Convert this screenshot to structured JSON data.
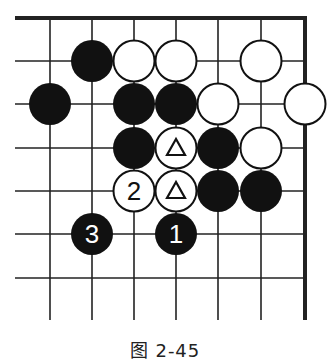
{
  "diagram": {
    "caption": "图 2-45",
    "board": {
      "columns": 7,
      "rows": 7,
      "edges": [
        "top",
        "right"
      ],
      "colors": {
        "black": "#111111",
        "white": "#ffffff",
        "line": "#222222"
      }
    },
    "stones": [
      {
        "col": 1,
        "row": 1,
        "color": "black",
        "label": ""
      },
      {
        "col": 2,
        "row": 1,
        "color": "white",
        "label": ""
      },
      {
        "col": 3,
        "row": 1,
        "color": "white",
        "label": ""
      },
      {
        "col": 5,
        "row": 1,
        "color": "white",
        "label": ""
      },
      {
        "col": 0,
        "row": 2,
        "color": "black",
        "label": ""
      },
      {
        "col": 2,
        "row": 2,
        "color": "black",
        "label": ""
      },
      {
        "col": 3,
        "row": 2,
        "color": "black",
        "label": ""
      },
      {
        "col": 4,
        "row": 2,
        "color": "white",
        "label": ""
      },
      {
        "col": 6,
        "row": 2,
        "color": "white",
        "label": ""
      },
      {
        "col": 2,
        "row": 3,
        "color": "black",
        "label": ""
      },
      {
        "col": 3,
        "row": 3,
        "color": "white",
        "label": "triangle"
      },
      {
        "col": 4,
        "row": 3,
        "color": "black",
        "label": ""
      },
      {
        "col": 5,
        "row": 3,
        "color": "white",
        "label": ""
      },
      {
        "col": 2,
        "row": 4,
        "color": "white",
        "label": "2"
      },
      {
        "col": 3,
        "row": 4,
        "color": "white",
        "label": "triangle"
      },
      {
        "col": 4,
        "row": 4,
        "color": "black",
        "label": ""
      },
      {
        "col": 5,
        "row": 4,
        "color": "black",
        "label": ""
      },
      {
        "col": 1,
        "row": 5,
        "color": "black",
        "label": "3"
      },
      {
        "col": 3,
        "row": 5,
        "color": "black",
        "label": "1"
      }
    ]
  }
}
